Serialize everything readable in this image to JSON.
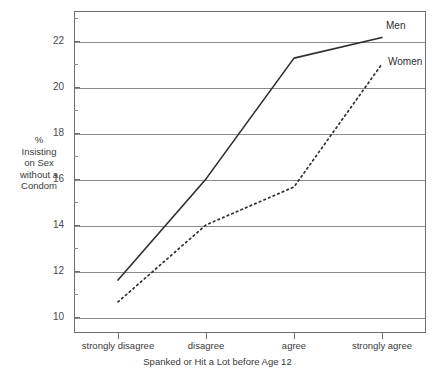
{
  "figure": {
    "title_remnant": "",
    "background": "#ffffff",
    "frame_color": "#6e6e6e",
    "grid_color": "#8a8a8a"
  },
  "axes": {
    "y": {
      "title_lines": [
        "%",
        "Insisting",
        "on Sex",
        "without a",
        "Condom"
      ],
      "major_ticks": [
        "22",
        "20",
        "18",
        "16",
        "14",
        "12",
        "10"
      ],
      "min": 9.3,
      "max": 23.3
    },
    "x": {
      "title": "Spanked or Hit a Lot before Age 12",
      "categories": [
        "strongly disagree",
        "disagree",
        "agree",
        "strongly agree"
      ]
    }
  },
  "annotations": {
    "men_label": "Men",
    "women_label": "Women"
  },
  "chart_data": {
    "type": "line",
    "title": "",
    "xlabel": "Spanked or Hit a Lot before Age 12",
    "ylabel": "% Insisting on Sex without a Condom",
    "categories": [
      "strongly disagree",
      "disagree",
      "agree",
      "strongly agree"
    ],
    "ylim": [
      9.3,
      23.3
    ],
    "yticks": [
      10,
      12,
      14,
      16,
      18,
      20,
      22
    ],
    "yminorticks": [
      11,
      13,
      15,
      17,
      19,
      21,
      23
    ],
    "grid": "horizontal",
    "legend": "inline-end-of-line",
    "series": [
      {
        "name": "Men",
        "style": "solid",
        "color": "#2e2e2e",
        "values": [
          11.6,
          16.0,
          21.25,
          22.15
        ]
      },
      {
        "name": "Women",
        "style": "dotted",
        "color": "#2e2e2e",
        "values": [
          10.65,
          14.0,
          15.65,
          21.0
        ]
      }
    ]
  }
}
